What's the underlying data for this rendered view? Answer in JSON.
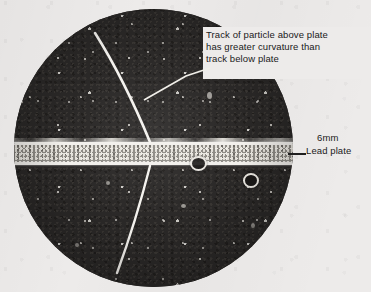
{
  "figure": {
    "type": "cloud-chamber-photograph"
  },
  "annotations": {
    "track_callout": {
      "line1": "Track of particle above plate",
      "line2": "has greater curvature than",
      "line3": "track below plate",
      "leader": "diagonal-leader-line"
    },
    "plate_label": {
      "thickness": "6mm",
      "name": "Lead plate",
      "leader": "horizontal-leader-line"
    }
  },
  "colors": {
    "page_background": "#edebea",
    "chamber_dark": "#2b2927",
    "track_white": "#f4f2ee",
    "plate_band": "#8d8a84",
    "plate_edge": "#f2f0ec",
    "text": "#1a1a1a"
  },
  "geometry": {
    "chamber_center_x": 153,
    "chamber_center_y": 148,
    "chamber_radius": 139,
    "plate_top_y": 142,
    "plate_bottom_y": 165,
    "plate_thickness_label": "6mm"
  },
  "features": {
    "upper_track": {
      "label": "upper-particle-track",
      "description": "strongly curved bright track above the lead plate"
    },
    "lower_track": {
      "label": "lower-particle-track",
      "description": "nearly straight bright track below the lead plate"
    },
    "ring_artifacts": [
      {
        "label": "droplet-ring-1"
      },
      {
        "label": "droplet-ring-2"
      }
    ]
  }
}
